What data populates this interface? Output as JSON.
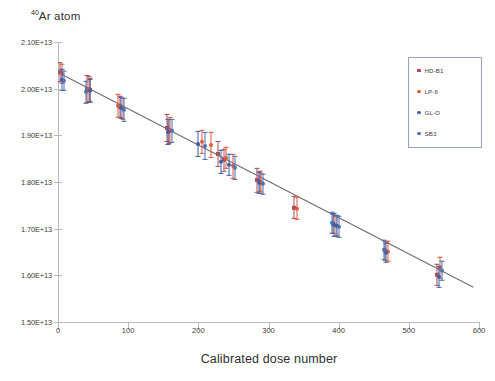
{
  "chart_data": {
    "type": "scatter",
    "title": "40Ar atom",
    "title_sup": "40",
    "title_rest": "Ar atom",
    "xlabel": "Calibrated dose number",
    "ylabel": "",
    "xlim": [
      0,
      600
    ],
    "ylim": [
      15000000000000.0,
      21000000000000.0
    ],
    "xticks": [
      0,
      100,
      200,
      300,
      400,
      500,
      600
    ],
    "xtick_labels": [
      "0",
      "100",
      "200",
      "300",
      "400",
      "500",
      "600"
    ],
    "yticks": [
      15000000000000.0,
      16000000000000.0,
      17000000000000.0,
      18000000000000.0,
      19000000000000.0,
      20000000000000.0,
      21000000000000.0
    ],
    "ytick_labels": [
      "1.50E+13",
      "1.60E+13",
      "1.70E+13",
      "1.80E+13",
      "1.90E+13",
      "2.00E+13",
      "2.10E+13"
    ],
    "grid": false,
    "legend_position": "upper right",
    "trendline": {
      "type": "linear",
      "x": [
        0,
        592
      ],
      "y": [
        20345000000000.0,
        15745000000000.0
      ],
      "color": "#6b6b78"
    },
    "series": [
      {
        "name": "HD-B1",
        "color": "#a94f5e",
        "marker": "square",
        "points": [
          {
            "x": 3,
            "y": 20355000000000.0,
            "err": 210000000000.0
          },
          {
            "x": 42,
            "y": 19985000000000.0,
            "err": 300000000000.0
          },
          {
            "x": 45,
            "y": 19975000000000.0,
            "err": 260000000000.0
          },
          {
            "x": 88,
            "y": 19615000000000.0,
            "err": 240000000000.0
          },
          {
            "x": 155,
            "y": 19155000000000.0,
            "err": 300000000000.0
          },
          {
            "x": 158,
            "y": 19085000000000.0,
            "err": 260000000000.0
          },
          {
            "x": 228,
            "y": 18595000000000.0,
            "err": 280000000000.0
          },
          {
            "x": 236,
            "y": 18465000000000.0,
            "err": 240000000000.0
          },
          {
            "x": 284,
            "y": 18035000000000.0,
            "err": 260000000000.0
          },
          {
            "x": 288,
            "y": 18015000000000.0,
            "err": 220000000000.0
          },
          {
            "x": 336,
            "y": 17455000000000.0,
            "err": 240000000000.0
          },
          {
            "x": 392,
            "y": 17105000000000.0,
            "err": 220000000000.0
          },
          {
            "x": 466,
            "y": 16525000000000.0,
            "err": 220000000000.0
          },
          {
            "x": 540,
            "y": 16015000000000.0,
            "err": 240000000000.0
          }
        ]
      },
      {
        "name": "LP-6",
        "color": "#e05a3a",
        "marker": "circle",
        "points": [
          {
            "x": 6,
            "y": 20325000000000.0,
            "err": 220000000000.0
          },
          {
            "x": 44,
            "y": 19985000000000.0,
            "err": 280000000000.0
          },
          {
            "x": 86,
            "y": 19635000000000.0,
            "err": 260000000000.0
          },
          {
            "x": 92,
            "y": 19565000000000.0,
            "err": 240000000000.0
          },
          {
            "x": 160,
            "y": 19125000000000.0,
            "err": 280000000000.0
          },
          {
            "x": 205,
            "y": 18855000000000.0,
            "err": 260000000000.0
          },
          {
            "x": 218,
            "y": 18795000000000.0,
            "err": 280000000000.0
          },
          {
            "x": 240,
            "y": 18525000000000.0,
            "err": 240000000000.0
          },
          {
            "x": 249,
            "y": 18335000000000.0,
            "err": 260000000000.0
          },
          {
            "x": 290,
            "y": 17975000000000.0,
            "err": 220000000000.0
          },
          {
            "x": 340,
            "y": 17435000000000.0,
            "err": 240000000000.0
          },
          {
            "x": 396,
            "y": 17065000000000.0,
            "err": 220000000000.0
          },
          {
            "x": 470,
            "y": 16515000000000.0,
            "err": 220000000000.0
          },
          {
            "x": 545,
            "y": 16165000000000.0,
            "err": 240000000000.0
          }
        ]
      },
      {
        "name": "GL-O",
        "color": "#3b5fa8",
        "marker": "circle",
        "points": [
          {
            "x": 5,
            "y": 20185000000000.0,
            "err": 240000000000.0
          },
          {
            "x": 46,
            "y": 19945000000000.0,
            "err": 260000000000.0
          },
          {
            "x": 90,
            "y": 19585000000000.0,
            "err": 240000000000.0
          },
          {
            "x": 157,
            "y": 19065000000000.0,
            "err": 280000000000.0
          },
          {
            "x": 200,
            "y": 18815000000000.0,
            "err": 280000000000.0
          },
          {
            "x": 232,
            "y": 18425000000000.0,
            "err": 260000000000.0
          },
          {
            "x": 244,
            "y": 18365000000000.0,
            "err": 240000000000.0
          },
          {
            "x": 286,
            "y": 17985000000000.0,
            "err": 240000000000.0
          },
          {
            "x": 394,
            "y": 17085000000000.0,
            "err": 260000000000.0
          },
          {
            "x": 398,
            "y": 17055000000000.0,
            "err": 240000000000.0
          },
          {
            "x": 468,
            "y": 16485000000000.0,
            "err": 220000000000.0
          },
          {
            "x": 543,
            "y": 15975000000000.0,
            "err": 240000000000.0
          }
        ]
      },
      {
        "name": "SB3",
        "color": "#4a73b5",
        "marker": "circle",
        "points": [
          {
            "x": 8,
            "y": 20165000000000.0,
            "err": 220000000000.0
          },
          {
            "x": 40,
            "y": 19925000000000.0,
            "err": 240000000000.0
          },
          {
            "x": 94,
            "y": 19545000000000.0,
            "err": 260000000000.0
          },
          {
            "x": 162,
            "y": 19095000000000.0,
            "err": 260000000000.0
          },
          {
            "x": 210,
            "y": 18765000000000.0,
            "err": 300000000000.0
          },
          {
            "x": 252,
            "y": 18295000000000.0,
            "err": 260000000000.0
          },
          {
            "x": 292,
            "y": 17955000000000.0,
            "err": 220000000000.0
          },
          {
            "x": 390,
            "y": 17125000000000.0,
            "err": 240000000000.0
          },
          {
            "x": 400,
            "y": 17035000000000.0,
            "err": 240000000000.0
          },
          {
            "x": 464,
            "y": 16545000000000.0,
            "err": 220000000000.0
          },
          {
            "x": 547,
            "y": 16095000000000.0,
            "err": 220000000000.0
          }
        ]
      }
    ]
  },
  "legend": {
    "items": [
      {
        "label": "HD-B1",
        "color": "#a94f5e",
        "marker": "square"
      },
      {
        "label": "LP-6",
        "color": "#e05a3a",
        "marker": "circle"
      },
      {
        "label": "GL-O",
        "color": "#3b5fa8",
        "marker": "circle"
      },
      {
        "label": "SB3",
        "color": "#4a73b5",
        "marker": "circle"
      }
    ]
  }
}
